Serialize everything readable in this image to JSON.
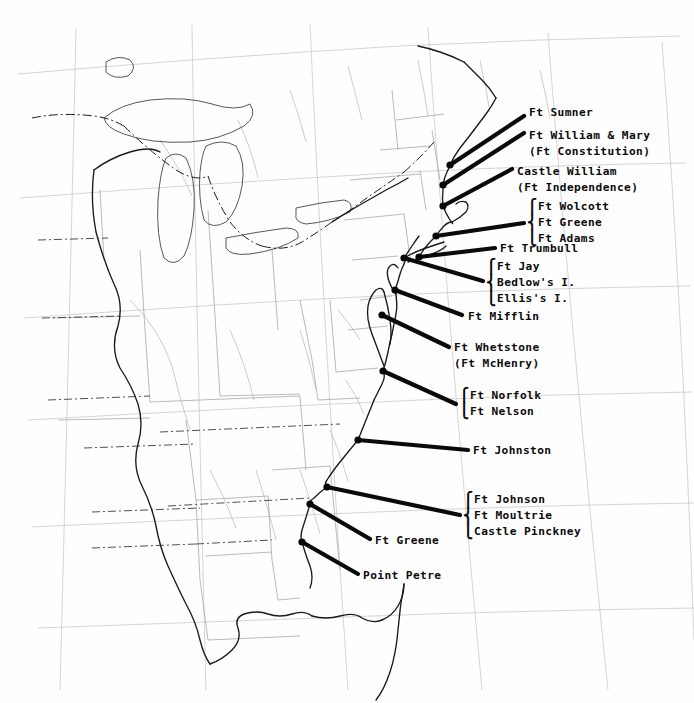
{
  "figure": {
    "kind": "historical-map",
    "region": "Eastern United States",
    "background_color": "#ffffff",
    "ink_color": "#0b0b0b",
    "coast_color": "#222222",
    "graticule_color": "#b9b9b9",
    "state_border_color": "#9a9a9a",
    "width": 694,
    "height": 703
  },
  "annotations": [
    {
      "id": "ft-sumner",
      "lines": [
        "Ft Sumner"
      ],
      "brace": false,
      "text_x": 529,
      "text_y": 105,
      "marker": {
        "x": 450,
        "y": 165
      },
      "leader": {
        "x1": 450,
        "y1": 165,
        "x2": 524,
        "y2": 116
      }
    },
    {
      "id": "ft-william-and-mary",
      "lines": [
        "Ft William & Mary",
        "(Ft Constitution)"
      ],
      "brace": false,
      "text_x": 529,
      "text_y": 128,
      "marker": {
        "x": 443,
        "y": 185
      },
      "leader": {
        "x1": 443,
        "y1": 185,
        "x2": 524,
        "y2": 133
      }
    },
    {
      "id": "castle-william",
      "lines": [
        "Castle William",
        "(Ft Independence)"
      ],
      "brace": false,
      "text_x": 517,
      "text_y": 164,
      "marker": {
        "x": 443,
        "y": 206
      },
      "leader": {
        "x1": 443,
        "y1": 206,
        "x2": 512,
        "y2": 169
      }
    },
    {
      "id": "newport-group",
      "lines": [
        "Ft Wolcott",
        "Ft Greene",
        "Ft Adams"
      ],
      "brace": true,
      "brace_x": 528,
      "text_x": 538,
      "text_y": 199,
      "marker": {
        "x": 436,
        "y": 236
      },
      "leader": {
        "x1": 436,
        "y1": 236,
        "x2": 524,
        "y2": 223
      }
    },
    {
      "id": "ft-trumbull",
      "lines": [
        "Ft Trumbull"
      ],
      "brace": false,
      "text_x": 500,
      "text_y": 241,
      "marker": {
        "x": 419,
        "y": 257
      },
      "leader": {
        "x1": 419,
        "y1": 257,
        "x2": 495,
        "y2": 248
      }
    },
    {
      "id": "new-york-harbor-group",
      "lines": [
        "Ft Jay",
        "Bedlow's I.",
        "Ellis's I."
      ],
      "brace": true,
      "brace_x": 487,
      "text_x": 497,
      "text_y": 259,
      "marker": {
        "x": 404,
        "y": 258
      },
      "leader": {
        "x1": 404,
        "y1": 258,
        "x2": 483,
        "y2": 281
      }
    },
    {
      "id": "ft-mifflin",
      "lines": [
        "Ft Mifflin"
      ],
      "brace": false,
      "text_x": 468,
      "text_y": 309,
      "marker": {
        "x": 395,
        "y": 290
      },
      "leader": {
        "x1": 395,
        "y1": 290,
        "x2": 462,
        "y2": 315
      }
    },
    {
      "id": "ft-whetstone",
      "lines": [
        "Ft Whetstone",
        "(Ft McHenry)"
      ],
      "brace": false,
      "text_x": 454,
      "text_y": 340,
      "marker": {
        "x": 382,
        "y": 315
      },
      "leader": {
        "x1": 382,
        "y1": 315,
        "x2": 449,
        "y2": 347
      }
    },
    {
      "id": "norfolk-group",
      "lines": [
        "Ft Norfolk",
        "Ft Nelson"
      ],
      "brace": true,
      "brace_x": 460,
      "text_x": 470,
      "text_y": 388,
      "marker": {
        "x": 383,
        "y": 371
      },
      "leader": {
        "x1": 383,
        "y1": 371,
        "x2": 456,
        "y2": 404
      }
    },
    {
      "id": "ft-johnston",
      "lines": [
        "Ft Johnston"
      ],
      "brace": false,
      "text_x": 473,
      "text_y": 443,
      "marker": {
        "x": 358,
        "y": 440
      },
      "leader": {
        "x1": 358,
        "y1": 440,
        "x2": 468,
        "y2": 450
      }
    },
    {
      "id": "charleston-group",
      "lines": [
        "Ft Johnson",
        "Ft Moultrie",
        "Castle Pinckney"
      ],
      "brace": true,
      "brace_x": 464,
      "text_x": 474,
      "text_y": 492,
      "marker": {
        "x": 327,
        "y": 487
      },
      "leader": {
        "x1": 327,
        "y1": 487,
        "x2": 460,
        "y2": 515
      }
    },
    {
      "id": "ft-greene",
      "lines": [
        "Ft Greene"
      ],
      "brace": false,
      "text_x": 375,
      "text_y": 533,
      "marker": {
        "x": 310,
        "y": 504
      },
      "leader": {
        "x1": 310,
        "y1": 504,
        "x2": 370,
        "y2": 539
      }
    },
    {
      "id": "point-petre",
      "lines": [
        "Point Petre"
      ],
      "brace": false,
      "text_x": 363,
      "text_y": 568,
      "marker": {
        "x": 302,
        "y": 542
      },
      "leader": {
        "x1": 302,
        "y1": 542,
        "x2": 358,
        "y2": 574
      }
    }
  ]
}
